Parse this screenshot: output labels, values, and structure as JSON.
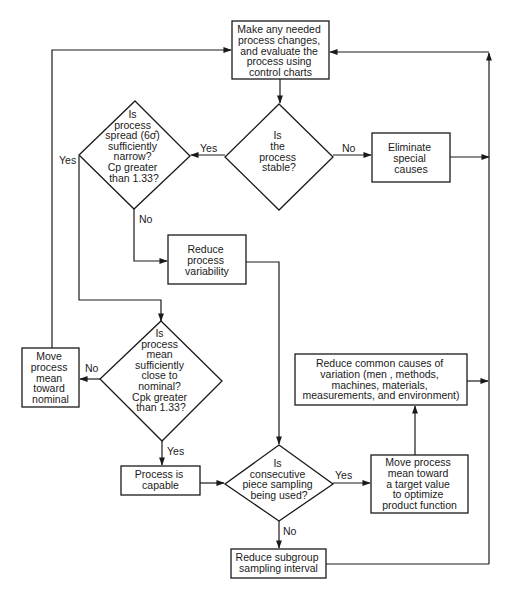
{
  "colors": {
    "stroke": "#1a1a1a",
    "background": "#ffffff"
  },
  "nodes": {
    "evaluate": {
      "type": "process",
      "lines": [
        "Make any needed",
        "process changes,",
        "and evaluate the",
        "process using",
        "control charts"
      ]
    },
    "stable": {
      "type": "decision",
      "lines": [
        "Is",
        "the",
        "process",
        "stable?"
      ]
    },
    "eliminate": {
      "type": "process",
      "lines": [
        "Eliminate",
        "special",
        "causes"
      ]
    },
    "spread": {
      "type": "decision",
      "lines": [
        "Is",
        "process",
        "spread (6σ̂)",
        "sufficiently",
        "narrow?",
        "Cp greater",
        "than 1.33?"
      ]
    },
    "reduce_variability": {
      "type": "process",
      "lines": [
        "Reduce",
        "process",
        "variability"
      ]
    },
    "mean_close": {
      "type": "decision",
      "lines": [
        "Is",
        "process",
        "mean",
        "sufficiently",
        "close to",
        "nominal?",
        "Cpk greater",
        "than 1.33?"
      ]
    },
    "move_nominal": {
      "type": "process",
      "lines": [
        "Move",
        "process",
        "mean",
        "toward",
        "nominal"
      ]
    },
    "capable": {
      "type": "process",
      "lines": [
        "Process is",
        "capable"
      ]
    },
    "consecutive": {
      "type": "decision",
      "lines": [
        "Is",
        "consecutive",
        "piece sampling",
        "being used?"
      ]
    },
    "move_target": {
      "type": "process",
      "lines": [
        "Move process",
        "mean toward",
        "a target value",
        "to optimize",
        "product function"
      ]
    },
    "common_causes": {
      "type": "process",
      "lines": [
        "Reduce common causes of",
        "variation (men , methods,",
        "machines, materials,",
        "measurements, and environment)"
      ]
    },
    "subgroup": {
      "type": "process",
      "lines": [
        "Reduce subgroup",
        "sampling interval"
      ]
    }
  },
  "edge_labels": {
    "stable_yes": "Yes",
    "stable_no": "No",
    "spread_yes": "Yes",
    "spread_no": "No",
    "mean_no": "No",
    "mean_yes": "Yes",
    "consecutive_yes": "Yes",
    "consecutive_no": "No"
  },
  "edges": [
    {
      "from": "evaluate",
      "to": "stable"
    },
    {
      "from": "stable",
      "to": "spread",
      "label": "Yes"
    },
    {
      "from": "stable",
      "to": "eliminate",
      "label": "No"
    },
    {
      "from": "eliminate",
      "to": "evaluate"
    },
    {
      "from": "spread",
      "to": "reduce_variability",
      "label": "No"
    },
    {
      "from": "spread",
      "to": "mean_close",
      "label": "Yes"
    },
    {
      "from": "reduce_variability",
      "to": "consecutive"
    },
    {
      "from": "mean_close",
      "to": "move_nominal",
      "label": "No"
    },
    {
      "from": "mean_close",
      "to": "capable",
      "label": "Yes"
    },
    {
      "from": "move_nominal",
      "to": "evaluate"
    },
    {
      "from": "capable",
      "to": "consecutive"
    },
    {
      "from": "consecutive",
      "to": "move_target",
      "label": "Yes"
    },
    {
      "from": "consecutive",
      "to": "subgroup",
      "label": "No"
    },
    {
      "from": "move_target",
      "to": "common_causes"
    },
    {
      "from": "common_causes",
      "to": "evaluate"
    },
    {
      "from": "subgroup",
      "to": "evaluate"
    }
  ]
}
